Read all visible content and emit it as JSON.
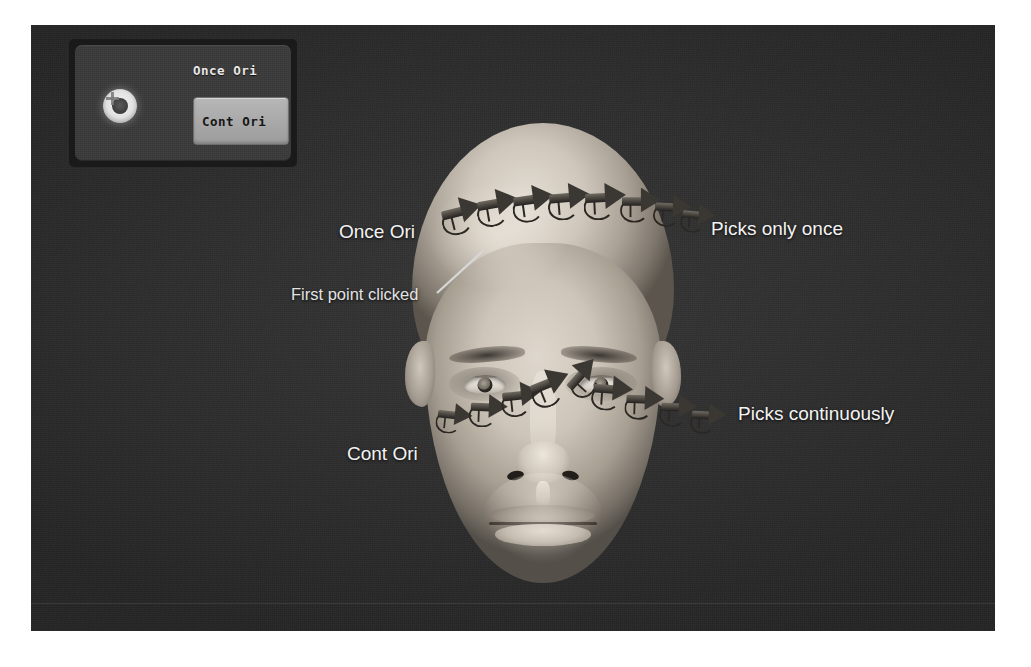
{
  "app": {
    "title": "Orientation Picking Viewport",
    "viewport_background": "#2e2e2e"
  },
  "tool_panel": {
    "name": "orientation-tool-panel",
    "dial_icon": "dial-knob-icon",
    "once_ori_label": "Once Ori",
    "cont_ori_label": "Cont Ori",
    "active_mode": "Cont Ori",
    "panel_bg": "#3a3a3a",
    "button_bg": "#a8a8a8",
    "label_color": "#e8e8e8"
  },
  "annotations": {
    "once_ori": "Once Ori",
    "picks_only_once": "Picks only once",
    "cont_ori": "Cont Ori",
    "picks_continuously": "Picks continuously",
    "first_point_clicked": "First point clicked",
    "text_color": "#f3f3f3"
  },
  "model": {
    "name": "human-head-3d-model",
    "description": "Bald male head, front view, grayscale shaded"
  },
  "gizmo_rows": {
    "forehead": {
      "label": "Once Ori",
      "count": 8,
      "markers": [
        {
          "x": 68,
          "y": 72,
          "rot": -14,
          "scale": 1.0
        },
        {
          "x": 104,
          "y": 64,
          "rot": -10,
          "scale": 1.0
        },
        {
          "x": 140,
          "y": 60,
          "rot": -8,
          "scale": 1.0
        },
        {
          "x": 176,
          "y": 58,
          "rot": -5,
          "scale": 1.0
        },
        {
          "x": 212,
          "y": 58,
          "rot": -3,
          "scale": 1.0
        },
        {
          "x": 248,
          "y": 62,
          "rot": 0,
          "scale": 0.95
        },
        {
          "x": 280,
          "y": 68,
          "rot": 3,
          "scale": 0.88
        },
        {
          "x": 306,
          "y": 76,
          "rot": 6,
          "scale": 0.8
        }
      ]
    },
    "cheek": {
      "label": "Cont Ori",
      "count": 9,
      "markers": [
        {
          "x": 62,
          "y": 276,
          "rot": 6,
          "scale": 0.84
        },
        {
          "x": 96,
          "y": 268,
          "rot": 2,
          "scale": 0.9
        },
        {
          "x": 128,
          "y": 256,
          "rot": -6,
          "scale": 0.94
        },
        {
          "x": 156,
          "y": 244,
          "rot": -22,
          "scale": 1.0
        },
        {
          "x": 188,
          "y": 236,
          "rot": -48,
          "scale": 0.92
        },
        {
          "x": 220,
          "y": 250,
          "rot": 4,
          "scale": 0.96
        },
        {
          "x": 252,
          "y": 260,
          "rot": 2,
          "scale": 0.92
        },
        {
          "x": 286,
          "y": 268,
          "rot": 2,
          "scale": 0.88
        },
        {
          "x": 316,
          "y": 276,
          "rot": 3,
          "scale": 0.84
        }
      ]
    }
  },
  "leader_line": {
    "name": "first-point-leader-line",
    "from": [
      2,
      46
    ],
    "to": [
      48,
      4
    ],
    "color": "#d8d8d8"
  }
}
